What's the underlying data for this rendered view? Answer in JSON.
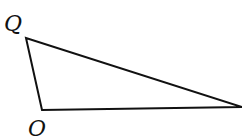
{
  "diagram": {
    "type": "triangle",
    "vertices": [
      {
        "label": "Q",
        "x": 26,
        "y": 38
      },
      {
        "label": "O",
        "x": 42,
        "y": 110
      },
      {
        "label": "",
        "x": 242,
        "y": 107
      }
    ],
    "labels": {
      "top": "Q",
      "bottom": "O"
    },
    "stroke_color": "#111111",
    "background": "#ffffff"
  }
}
